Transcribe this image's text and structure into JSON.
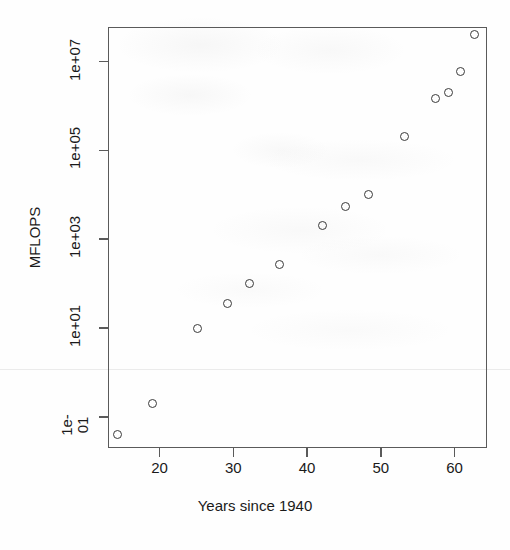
{
  "chart_data": {
    "type": "scatter",
    "title": "",
    "subtitle": "",
    "xlabel": "Years since 1940",
    "ylabel": "MFLOPS",
    "xlim": [
      13.0,
      64.4
    ],
    "ylim": [
      0.02,
      60000000.0
    ],
    "yscale": "log",
    "xscale": "linear",
    "grid": false,
    "legend": null,
    "legend_position": "none",
    "x_ticks": [
      20,
      30,
      40,
      50,
      60
    ],
    "x_tick_labels": [
      "20",
      "30",
      "40",
      "50",
      "60"
    ],
    "y_ticks": [
      0.1,
      10,
      1000,
      100000,
      10000000
    ],
    "y_tick_labels": [
      "1e-01",
      "1e+01",
      "1e+03",
      "1e+05",
      "1e+07"
    ],
    "marker": "open-circle",
    "marker_color": "#3a3a3a",
    "n_points": 14,
    "x": [
      14.3,
      19.1,
      25.2,
      29.2,
      32.2,
      36.2,
      42.1,
      45.2,
      48.3,
      53.2,
      57.4,
      59.2,
      60.8,
      62.7
    ],
    "y": [
      0.04,
      0.2,
      10,
      35,
      100,
      270,
      2000,
      5500,
      10000,
      210000,
      1500000,
      2000000,
      6000000,
      40000000
    ],
    "points": [
      {
        "x": 14.3,
        "y": 0.04
      },
      {
        "x": 19.1,
        "y": 0.2
      },
      {
        "x": 25.2,
        "y": 10
      },
      {
        "x": 29.2,
        "y": 35
      },
      {
        "x": 32.2,
        "y": 100
      },
      {
        "x": 36.2,
        "y": 270
      },
      {
        "x": 42.1,
        "y": 2000
      },
      {
        "x": 45.2,
        "y": 5500
      },
      {
        "x": 48.3,
        "y": 10000
      },
      {
        "x": 53.2,
        "y": 210000
      },
      {
        "x": 57.4,
        "y": 1500000
      },
      {
        "x": 59.2,
        "y": 2000000
      },
      {
        "x": 60.8,
        "y": 6000000
      },
      {
        "x": 62.7,
        "y": 40000000
      }
    ]
  },
  "colors": {
    "axis": "#5a5a5a",
    "text": "#1a1a1a",
    "marker": "#3a3a3a",
    "background": "#fefefe"
  }
}
